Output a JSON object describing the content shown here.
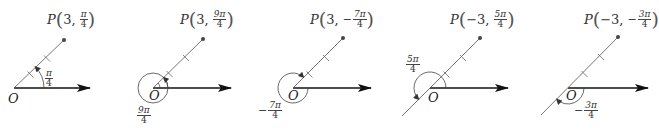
{
  "figure": {
    "colors": {
      "ink": "#222222",
      "ray": "#555555",
      "point": "#444444"
    },
    "panels": [
      {
        "id": "p1",
        "point_label": {
          "name": "P",
          "r": "3",
          "theta_sign": "",
          "theta_num": "π",
          "theta_coef": "",
          "theta_den": "4"
        },
        "origin_label": "O",
        "angle_label": {
          "sign": "",
          "num": "π",
          "coef": "",
          "den": "4"
        },
        "r": 3,
        "theta": "π/4",
        "angle_direction": "counterclockwise"
      },
      {
        "id": "p2",
        "point_label": {
          "name": "P",
          "r": "3",
          "theta_sign": "",
          "theta_num": "9π",
          "theta_coef": "",
          "theta_den": "4"
        },
        "origin_label": "O",
        "angle_label": {
          "sign": "",
          "num": "9π",
          "coef": "",
          "den": "4"
        },
        "r": 3,
        "theta": "9π/4",
        "angle_direction": "counterclockwise"
      },
      {
        "id": "p3",
        "point_label": {
          "name": "P",
          "r": "3",
          "theta_sign": "−",
          "theta_num": "7π",
          "theta_coef": "",
          "theta_den": "4"
        },
        "origin_label": "O",
        "angle_label": {
          "sign": "−",
          "num": "7π",
          "coef": "",
          "den": "4"
        },
        "r": 3,
        "theta": "−7π/4",
        "angle_direction": "clockwise"
      },
      {
        "id": "p4",
        "point_label": {
          "name": "P",
          "r": "−3",
          "theta_sign": "",
          "theta_num": "5π",
          "theta_coef": "",
          "theta_den": "4"
        },
        "origin_label": "O",
        "angle_label": {
          "sign": "",
          "num": "5π",
          "coef": "",
          "den": "4"
        },
        "r": -3,
        "theta": "5π/4",
        "angle_direction": "counterclockwise"
      },
      {
        "id": "p5",
        "point_label": {
          "name": "P",
          "r": "−3",
          "theta_sign": "−",
          "theta_num": "3π",
          "theta_coef": "",
          "theta_den": "4"
        },
        "origin_label": "O",
        "angle_label": {
          "sign": "−",
          "num": "3π",
          "coef": "",
          "den": "4"
        },
        "r": -3,
        "theta": "−3π/4",
        "angle_direction": "clockwise"
      }
    ]
  }
}
